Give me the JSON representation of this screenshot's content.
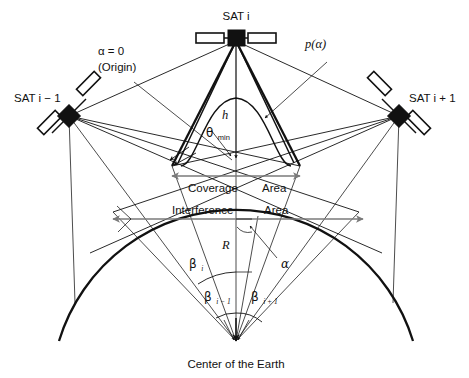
{
  "figure": {
    "kind": "satellite-constellation-geometry-diagram",
    "background": "#ffffff",
    "ink": "#111111",
    "accent_gray": "#7a7a7a"
  },
  "labels": {
    "sat_center": "SAT i",
    "sat_left": "SAT i − 1",
    "sat_right": "SAT i + 1",
    "origin_alpha": "α = 0",
    "origin_note": "(Origin)",
    "pattern": "p(α)",
    "altitude": "h",
    "theta_base": "θ",
    "theta_sub": "min",
    "coverage_left": "Coverage",
    "coverage_right": "Area",
    "interference_left": "Interference",
    "interference_right": "Area",
    "radius": "R",
    "alpha": "α",
    "beta_i_base": "β",
    "beta_i_sub": "i",
    "beta_im1_base": "β",
    "beta_im1_sub": "i − 1",
    "beta_ip1_base": "β",
    "beta_ip1_sub": "i + 1",
    "center_earth": "Center of the Earth"
  },
  "geometry": {
    "sat_center_xy": [
      236,
      38
    ],
    "sat_left_xy": [
      69,
      116
    ],
    "sat_right_xy": [
      399,
      116
    ],
    "earth_center_xy": [
      236,
      341
    ],
    "earth_radius": 185,
    "coverage_span": [
      172,
      300
    ],
    "interference_span": [
      113,
      359
    ]
  }
}
